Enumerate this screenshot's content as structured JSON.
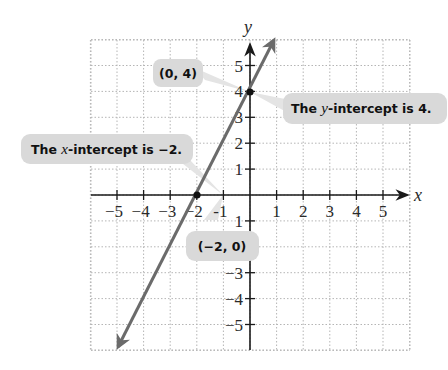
{
  "chart_data": {
    "type": "line",
    "title": "",
    "xlabel": "x",
    "ylabel": "y",
    "xlim": [
      -5.5,
      5.5
    ],
    "ylim": [
      -5.5,
      5.5
    ],
    "grid": true,
    "grid_style": "dotted",
    "x_ticks": [
      -5,
      -4,
      -3,
      -2,
      -1,
      1,
      2,
      3,
      4,
      5
    ],
    "y_ticks": [
      -5,
      -4,
      -3,
      -2,
      -1,
      1,
      2,
      3,
      4,
      5
    ],
    "x_tick_labels": [
      "−5",
      "−4",
      "−3",
      "−2",
      "-1",
      "1",
      "2",
      "3",
      "4",
      "5"
    ],
    "y_tick_labels": [
      "−5",
      "−4",
      "−3",
      "",
      "1",
      "1",
      "2",
      "3",
      "4",
      "5"
    ],
    "series": [
      {
        "name": "y = 2x + 4",
        "equation": "y = 2x + 4",
        "slope": 2,
        "intercept": 4,
        "x": [
          -5,
          0.7
        ],
        "y": [
          -6,
          5.4
        ],
        "arrows": "both",
        "color": "#6b6b6b"
      }
    ],
    "points": [
      {
        "x": 0,
        "y": 4,
        "label": "(0, 4)"
      },
      {
        "x": -2,
        "y": 0,
        "label": "(−2, 0)"
      }
    ],
    "annotations": [
      {
        "text_before": "The ",
        "var": "y",
        "text_after": "-intercept is 4.",
        "target": [
          0,
          4
        ]
      },
      {
        "text_before": "The ",
        "var": "x",
        "text_after": "-intercept is −2.",
        "target": [
          -2,
          0
        ]
      }
    ]
  },
  "labels": {
    "x_axis": "x",
    "y_axis": "y",
    "point_0_4": "(0, 4)",
    "point_neg2_0": "(−2, 0)",
    "y_intercept_before": "The ",
    "y_intercept_var": "y",
    "y_intercept_after": "-intercept is 4.",
    "x_intercept_before": "The ",
    "x_intercept_var": "x",
    "x_intercept_after": "-intercept is −2."
  },
  "colors": {
    "line": "#6b6b6b",
    "axis": "#1a1a1a",
    "grid": "#b5b5b5",
    "callout_bg": "#d9d9d9",
    "callout_pointer": "#e6e6e6"
  }
}
